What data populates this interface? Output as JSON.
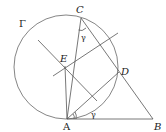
{
  "figure": {
    "circle_label": "Γ",
    "points": {
      "A": {
        "label": "A"
      },
      "B": {
        "label": "B"
      },
      "C": {
        "label": "C"
      },
      "D": {
        "label": "D"
      },
      "E": {
        "label": "E"
      }
    },
    "angle_labels": {
      "at_C": "γ",
      "at_A": "γ"
    }
  }
}
